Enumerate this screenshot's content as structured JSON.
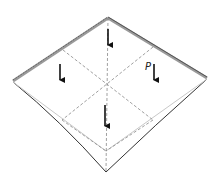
{
  "diagram": {
    "type": "plate-under-distributed-load",
    "load_label": "P",
    "colors": {
      "edge": "#333333",
      "support": "#9a9a9a",
      "deformed": "#c8c8c8",
      "dashed": "#888888",
      "arrow": "#111111"
    },
    "arrows": [
      {
        "name": "arrow-top",
        "x": 108,
        "y1": 29,
        "y2": 46
      },
      {
        "name": "arrow-left",
        "x": 60,
        "y1": 64,
        "y2": 81
      },
      {
        "name": "arrow-right",
        "x": 154,
        "y1": 64,
        "y2": 81
      },
      {
        "name": "arrow-bottom",
        "x": 105,
        "y1": 105,
        "y2": 127
      }
    ]
  }
}
